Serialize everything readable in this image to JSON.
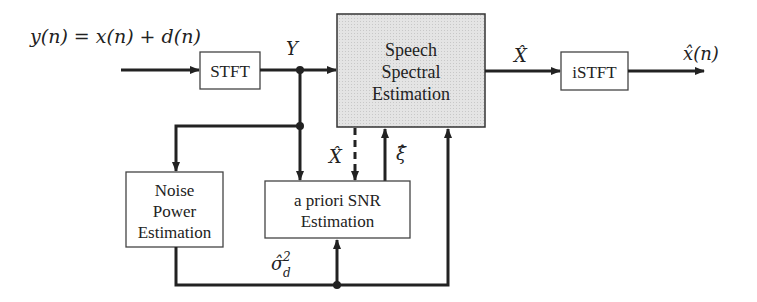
{
  "diagram": {
    "type": "block-diagram",
    "colors": {
      "line": "#222222",
      "box_border": "#333333",
      "shaded_fill": "#e2e2e2",
      "box_fill": "#ffffff"
    },
    "input_label": "y(n) = x(n) + d(n)",
    "output_label": "x̂(n)",
    "signals": {
      "Y": "Y",
      "X_hat_top": "X̂",
      "X_hat_feedback": "X̂",
      "xi_hat": "ξ̂",
      "sigma_hat": "σ̂",
      "sigma_sup": "2",
      "sigma_sub": "d"
    },
    "blocks": {
      "stft": {
        "label": "STFT"
      },
      "speech": {
        "lines": [
          "Speech",
          "Spectral",
          "Estimation"
        ]
      },
      "istft": {
        "label": "iSTFT"
      },
      "noise": {
        "lines": [
          "Noise",
          "Power",
          "Estimation"
        ]
      },
      "snr": {
        "lines": [
          "a priori SNR",
          "Estimation"
        ]
      }
    }
  }
}
